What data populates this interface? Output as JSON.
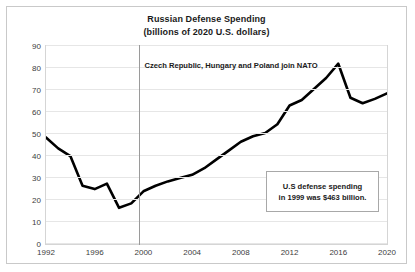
{
  "chart_data": {
    "type": "line",
    "title": "Russian Defense Spending",
    "subtitle": "(billions of 2020 U.S. dollars)",
    "xlabel": "",
    "ylabel": "",
    "xlim": [
      1992,
      2020
    ],
    "ylim": [
      0,
      90
    ],
    "grid": true,
    "legend": false,
    "y_ticks": [
      90,
      80,
      70,
      60,
      50,
      40,
      30,
      20,
      10,
      0
    ],
    "x_ticks": [
      1992,
      1996,
      2000,
      2004,
      2008,
      2012,
      2016,
      2020
    ],
    "series": [
      {
        "name": "Russian defense spending",
        "color": "#000000",
        "x": [
          1992,
          1993,
          1994,
          1995,
          1996,
          1997,
          1998,
          1999,
          2000,
          2001,
          2002,
          2003,
          2004,
          2005,
          2006,
          2007,
          2008,
          2009,
          2010,
          2011,
          2012,
          2013,
          2014,
          2015,
          2016,
          2017,
          2018,
          2019,
          2020
        ],
        "values": [
          48,
          43,
          39.5,
          26,
          24.5,
          27,
          16,
          18,
          23.5,
          26,
          28,
          29.5,
          31,
          34,
          38,
          42,
          46,
          48.5,
          50,
          54,
          62.5,
          65,
          70,
          75,
          81.5,
          66,
          63.5,
          65.5,
          68
        ]
      }
    ],
    "annotations": [
      {
        "name": "nato-event-line",
        "type": "vertical-line",
        "x": 1999.6,
        "color": "#9a9a9a",
        "label": "Czech Republic, Hungary and Poland  join NATO"
      },
      {
        "name": "us-spending-callout",
        "type": "text-box",
        "lines": [
          "U.S defense spending",
          "in 1999 was $463 billion."
        ]
      }
    ]
  },
  "chart": {
    "title": "Russian Defense Spending",
    "subtitle": "(billions of 2020 U.S. dollars)",
    "event_label": "Czech Republic, Hungary and Poland  join NATO",
    "callout": {
      "line1": "U.S defense spending",
      "line2": "in 1999 was $463 billion."
    }
  }
}
